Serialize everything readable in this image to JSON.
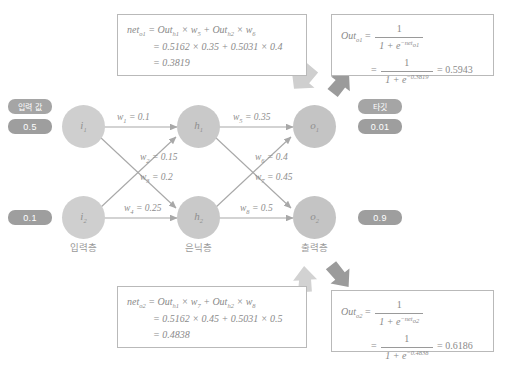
{
  "diagram": {
    "title_absent": true,
    "layers": [
      {
        "id": "input",
        "label": "입력층",
        "nodes": [
          {
            "id": "i1",
            "label": "i",
            "sub": "1"
          },
          {
            "id": "i2",
            "label": "i",
            "sub": "2"
          }
        ]
      },
      {
        "id": "hidden",
        "label": "은닉층",
        "nodes": [
          {
            "id": "h1",
            "label": "h",
            "sub": "1"
          },
          {
            "id": "h2",
            "label": "h",
            "sub": "2"
          }
        ]
      },
      {
        "id": "output",
        "label": "출력층",
        "nodes": [
          {
            "id": "o1",
            "label": "o",
            "sub": "1"
          },
          {
            "id": "o2",
            "label": "o",
            "sub": "2"
          }
        ]
      }
    ],
    "input_section": {
      "caption": "입력 값",
      "values": [
        "0.5",
        "0.1"
      ]
    },
    "target_section": {
      "caption": "타깃",
      "values": [
        "0.01",
        "0.9"
      ]
    },
    "weights": [
      {
        "name": "w",
        "sub": "1",
        "eq": "= 0.1",
        "value": 0.1
      },
      {
        "name": "w",
        "sub": "2",
        "eq": "= 0.15",
        "value": 0.15
      },
      {
        "name": "w",
        "sub": "3",
        "eq": "= 0.2",
        "value": 0.2
      },
      {
        "name": "w",
        "sub": "4",
        "eq": "= 0.25",
        "value": 0.25
      },
      {
        "name": "w",
        "sub": "5",
        "eq": "= 0.35",
        "value": 0.35
      },
      {
        "name": "w",
        "sub": "6",
        "eq": "= 0.4",
        "value": 0.4
      },
      {
        "name": "w",
        "sub": "7",
        "eq": "= 0.45",
        "value": 0.45
      },
      {
        "name": "w",
        "sub": "8",
        "eq": "= 0.5",
        "value": 0.5
      }
    ],
    "colors": {
      "node": "#cfcfcf",
      "pill": "#9e9e9e",
      "edge": "#a8a8a8",
      "box_border": "#b9b9b9",
      "text": "#8d8d8d",
      "arrow_dark": "#9b9b9b",
      "arrow_light": "#d2d2d2"
    }
  },
  "formulas": {
    "net_o1": {
      "lhs_name": "net",
      "lhs_sub": "o1",
      "line1": "= Out",
      "line1_sub_a": "h1",
      "line1_mid": "× w",
      "line1_sub_b": "5",
      "line1_plus": "+ Out",
      "line1_sub_c": "h2",
      "line1_mid2": "× w",
      "line1_sub_d": "6",
      "line2": "= 0.5162 × 0.35 + 0.5031 × 0.4",
      "line3": "= 0.3819"
    },
    "out_o1": {
      "lhs_name": "Out",
      "lhs_sub": "o1",
      "num": "1",
      "den_prefix": "1 + e",
      "den_exp": "−net",
      "den_exp_sub": "o1",
      "num2": "1",
      "den2_prefix": "1 + e",
      "den2_exp": "−0.3819",
      "result": "= 0.5943"
    },
    "net_o2": {
      "lhs_name": "net",
      "lhs_sub": "o2",
      "line1": "= Out",
      "line1_sub_a": "h1",
      "line1_mid": "× w",
      "line1_sub_b": "7",
      "line1_plus": "+ Out",
      "line1_sub_c": "h2",
      "line1_mid2": "× w",
      "line1_sub_d": "8",
      "line2": "= 0.5162 × 0.45 + 0.5031 × 0.5",
      "line3": "= 0.4838"
    },
    "out_o2": {
      "lhs_name": "Out",
      "lhs_sub": "o2",
      "num": "1",
      "den_prefix": "1 + e",
      "den_exp": "−net",
      "den_exp_sub": "o2",
      "num2": "1",
      "den2_prefix": "1 + e",
      "den2_exp": "−0.4838",
      "result": "= 0.6186"
    }
  }
}
